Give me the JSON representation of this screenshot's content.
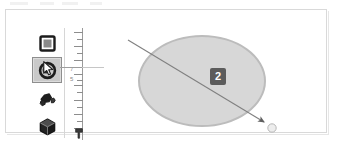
{
  "window": {
    "background_color": "#ffffff",
    "border_color": "#d9d9d9"
  },
  "tool_palette": {
    "name": "shape-tools",
    "selected_index": 1,
    "selected_color": "#c9c9c9",
    "tools": [
      {
        "id": "rectangle",
        "icon": "rectangle-icon",
        "label": "Rectangle",
        "selected": false
      },
      {
        "id": "ellipse",
        "icon": "ellipse-icon",
        "label": "Ellipse",
        "selected": true
      },
      {
        "id": "polygon",
        "icon": "polygon-icon",
        "label": "Polygon",
        "selected": false
      },
      {
        "id": "cube",
        "icon": "cube-icon",
        "label": "3D Box",
        "selected": false
      }
    ],
    "cursor": {
      "icon": "mouse-pointer-icon",
      "visible": true
    }
  },
  "ruler": {
    "orientation": "vertical",
    "axis_color": "#9a9a9a",
    "tick_color": "#8d8d8d",
    "label_color": "#8a8a8a",
    "labels": [
      {
        "text": "7",
        "y": 40
      },
      {
        "text": "5",
        "y": 50
      }
    ],
    "major_ticks": [
      4,
      18,
      32,
      46,
      57,
      72,
      86,
      100
    ],
    "minor_ticks": [
      11,
      25,
      39,
      52,
      64,
      79,
      93
    ],
    "marker": {
      "icon": "ruler-marker-icon",
      "y": 100
    }
  },
  "canvas": {
    "guide_line_color": "#9d9d9d",
    "shape": {
      "type": "ellipse",
      "name": "ellipse-shape",
      "fill": "#d7d7d7",
      "stroke": "#bcbcbc",
      "stroke_width": 2
    },
    "badge": {
      "text": "2",
      "background": "#5c5c5c",
      "text_color": "#ffffff"
    },
    "drag_arrow": {
      "name": "drag-arrow",
      "color": "#6e6e6e",
      "from_x": 32,
      "from_y": 18,
      "to_x": 172,
      "to_y": 103,
      "handle_fill": "#ececec",
      "handle_stroke": "#b5b5b5"
    }
  }
}
